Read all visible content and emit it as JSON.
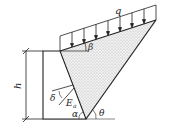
{
  "figure": {
    "labels": {
      "load": "q",
      "backfill_angle": "β",
      "height": "h",
      "wall_friction_angle": "δ",
      "active_thrust": "E",
      "active_thrust_subscript": "a",
      "wall_back_angle": "α",
      "failure_plane_angle": "θ"
    },
    "colors": {
      "line": "#222222",
      "soil_fill": "#e6e6e6",
      "ground": "#888888"
    }
  }
}
